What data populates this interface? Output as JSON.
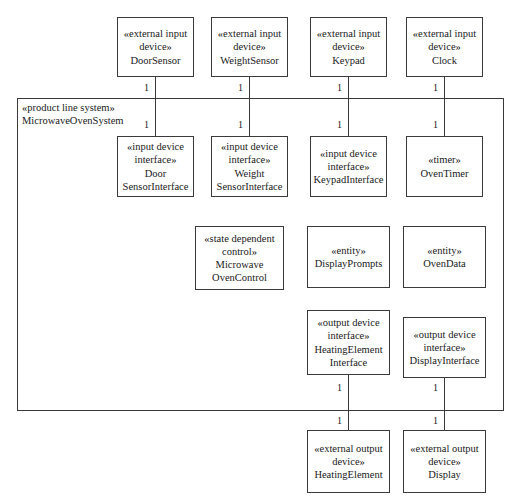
{
  "diagram": {
    "system": {
      "stereotype": "«product line system»",
      "name": "MicrowaveOvenSystem"
    },
    "multiplicity_label": "1",
    "boxes": [
      {
        "id": "door-sensor",
        "lines": [
          "«external input",
          "device»",
          "DoorSensor"
        ],
        "x": 117,
        "y": 17,
        "w": 77,
        "h": 60
      },
      {
        "id": "weight-sensor",
        "lines": [
          "«external input",
          "device»",
          "WeightSensor"
        ],
        "x": 211,
        "y": 17,
        "w": 77,
        "h": 60
      },
      {
        "id": "keypad",
        "lines": [
          "«external input",
          "device»",
          "Keypad"
        ],
        "x": 310,
        "y": 17,
        "w": 77,
        "h": 60
      },
      {
        "id": "clock",
        "lines": [
          "«external input",
          "device»",
          "Clock"
        ],
        "x": 406,
        "y": 17,
        "w": 77,
        "h": 60
      },
      {
        "id": "door-sensor-interface",
        "lines": [
          "«input device",
          "interface»",
          "Door",
          "SensorInterface"
        ],
        "x": 117,
        "y": 136,
        "w": 77,
        "h": 61
      },
      {
        "id": "weight-sensor-interface",
        "lines": [
          "«input device",
          "interface»",
          "Weight",
          "SensorInterface"
        ],
        "x": 211,
        "y": 136,
        "w": 77,
        "h": 61
      },
      {
        "id": "keypad-interface",
        "lines": [
          "«input device",
          "interface»",
          "KeypadInterface"
        ],
        "x": 310,
        "y": 136,
        "w": 77,
        "h": 61
      },
      {
        "id": "oven-timer",
        "lines": [
          "«timer»",
          "OvenTimer"
        ],
        "x": 406,
        "y": 136,
        "w": 77,
        "h": 61
      },
      {
        "id": "microwave-oven-control",
        "lines": [
          "«state dependent",
          "control»",
          "Microwave",
          "OvenControl"
        ],
        "x": 195,
        "y": 226,
        "w": 89,
        "h": 64
      },
      {
        "id": "display-prompts",
        "lines": [
          "«entity»",
          "DisplayPrompts"
        ],
        "x": 307,
        "y": 226,
        "w": 83,
        "h": 62
      },
      {
        "id": "oven-data",
        "lines": [
          "«entity»",
          "OvenData"
        ],
        "x": 403,
        "y": 226,
        "w": 83,
        "h": 62
      },
      {
        "id": "heating-element-interface",
        "lines": [
          "«output device",
          "interface»",
          "HeatingElement",
          "Interface"
        ],
        "x": 307,
        "y": 310,
        "w": 83,
        "h": 65
      },
      {
        "id": "display-interface",
        "lines": [
          "«output device",
          "interface»",
          "DisplayInterface"
        ],
        "x": 403,
        "y": 317,
        "w": 83,
        "h": 61
      },
      {
        "id": "heating-element",
        "lines": [
          "«external output",
          "device»",
          "HeatingElement"
        ],
        "x": 307,
        "y": 430,
        "w": 83,
        "h": 63
      },
      {
        "id": "display",
        "lines": [
          "«external output",
          "device»",
          "Display"
        ],
        "x": 403,
        "y": 430,
        "w": 83,
        "h": 63
      }
    ],
    "connectors": [
      {
        "id": "door-sensor-connector",
        "x": 155,
        "y": 77,
        "h": 59
      },
      {
        "id": "weight-sensor-connector",
        "x": 249,
        "y": 77,
        "h": 59
      },
      {
        "id": "keypad-connector",
        "x": 348,
        "y": 77,
        "h": 59
      },
      {
        "id": "clock-connector",
        "x": 444,
        "y": 77,
        "h": 59
      },
      {
        "id": "heating-element-connector",
        "x": 348,
        "y": 375,
        "h": 55
      },
      {
        "id": "display-connector",
        "x": 444,
        "y": 378,
        "h": 52
      }
    ],
    "multiplicities": [
      {
        "id": "door-sensor-top",
        "x": 143,
        "y": 83
      },
      {
        "id": "door-sensor-bottom",
        "x": 143,
        "y": 120
      },
      {
        "id": "weight-sensor-top",
        "x": 237,
        "y": 83
      },
      {
        "id": "weight-sensor-bottom",
        "x": 237,
        "y": 120
      },
      {
        "id": "keypad-top",
        "x": 336,
        "y": 83
      },
      {
        "id": "keypad-bottom",
        "x": 336,
        "y": 120
      },
      {
        "id": "clock-top",
        "x": 432,
        "y": 83
      },
      {
        "id": "clock-bottom",
        "x": 432,
        "y": 120
      },
      {
        "id": "heating-element-top",
        "x": 336,
        "y": 383
      },
      {
        "id": "heating-element-bottom",
        "x": 336,
        "y": 416
      },
      {
        "id": "display-top",
        "x": 432,
        "y": 383
      },
      {
        "id": "display-bottom",
        "x": 432,
        "y": 416
      }
    ],
    "system_box": {
      "x": 17,
      "y": 98,
      "w": 487,
      "h": 313
    },
    "system_label_pos": {
      "x": 22,
      "y": 101
    }
  }
}
